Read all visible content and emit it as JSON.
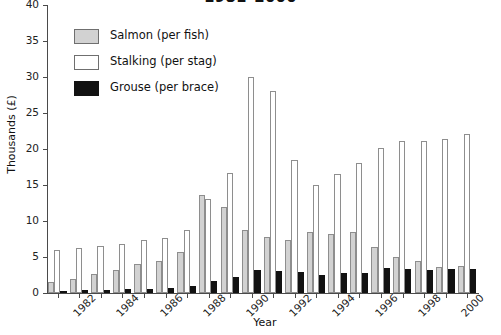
{
  "chart_data": {
    "type": "bar",
    "title": "1981–2000",
    "xlabel": "Year",
    "ylabel": "Thousands (£)",
    "ylim": [
      0,
      40
    ],
    "ytick_values": [
      0,
      5,
      10,
      15,
      20,
      25,
      30,
      35,
      40
    ],
    "ytick_labels": [
      "0",
      "5",
      "10",
      "15",
      "20",
      "25",
      "30",
      "35",
      "40"
    ],
    "grid": false,
    "legend_position": "upper left",
    "categories": [
      1981,
      1982,
      1983,
      1984,
      1985,
      1986,
      1987,
      1988,
      1989,
      1990,
      1991,
      1992,
      1993,
      1994,
      1995,
      1996,
      1997,
      1998,
      1999,
      2000
    ],
    "xtick_labels": [
      "1982",
      "1984",
      "1986",
      "1988",
      "1990",
      "1992",
      "1994",
      "1996",
      "1998",
      "2000"
    ],
    "xtick_categories": [
      1982,
      1984,
      1986,
      1988,
      1990,
      1992,
      1994,
      1996,
      1998,
      2000
    ],
    "series": [
      {
        "name": "Salmon (per fish)",
        "color": "#d2d2d2",
        "values": [
          1.5,
          1.9,
          2.6,
          3.2,
          4.0,
          4.4,
          5.7,
          13.6,
          12.0,
          8.8,
          7.8,
          7.3,
          8.5,
          8.2,
          8.5,
          6.4,
          5.0,
          4.5,
          3.6,
          3.8
        ]
      },
      {
        "name": "Stalking (per stag)",
        "color": "#ffffff",
        "values": [
          6.0,
          6.2,
          6.5,
          6.8,
          7.3,
          7.6,
          8.7,
          13.0,
          16.7,
          30.0,
          28.0,
          18.5,
          15.0,
          16.5,
          18.0,
          20.1,
          21.1,
          21.1,
          21.4,
          22.1
        ]
      },
      {
        "name": "Grouse (per brace)",
        "color": "#121212",
        "values": [
          0.3,
          0.4,
          0.4,
          0.5,
          0.5,
          0.7,
          1.0,
          1.6,
          2.2,
          3.2,
          3.0,
          2.9,
          2.5,
          2.8,
          2.8,
          3.5,
          3.4,
          3.2,
          3.4,
          3.3
        ]
      }
    ]
  },
  "legend": {
    "items": [
      {
        "label": "Salmon (per fish)",
        "key": "salmon"
      },
      {
        "label": "Stalking (per stag)",
        "key": "stalk"
      },
      {
        "label": "Grouse (per brace)",
        "key": "grouse"
      }
    ]
  }
}
